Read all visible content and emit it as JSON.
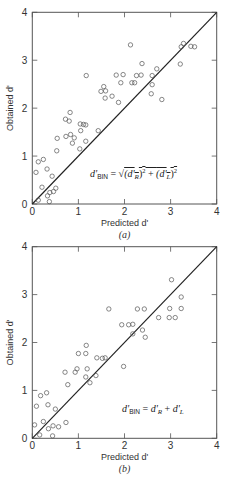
{
  "chart_data": [
    {
      "type": "scatter",
      "panel_label": "(a)",
      "xlabel": "Predicted d'",
      "ylabel": "Obtained d'",
      "xlim": [
        0,
        4
      ],
      "ylim": [
        0,
        4
      ],
      "xticks": [
        "0",
        "1",
        "2",
        "3",
        "4"
      ],
      "yticks": [
        "0",
        "1",
        "2",
        "3",
        "4"
      ],
      "grid": false,
      "annotation": "d'BIN = √((d'R)² + (d'L)²)",
      "reference_line": {
        "from": [
          0,
          0
        ],
        "to": [
          4,
          4
        ]
      },
      "points": [
        [
          0.08,
          0.66
        ],
        [
          0.13,
          0.88
        ],
        [
          0.24,
          0.93
        ],
        [
          0.13,
          0.08
        ],
        [
          0.21,
          0.35
        ],
        [
          0.32,
          0.73
        ],
        [
          0.33,
          0.17
        ],
        [
          0.38,
          0.24
        ],
        [
          0.37,
          0.05
        ],
        [
          0.43,
          0.58
        ],
        [
          0.46,
          0.26
        ],
        [
          0.51,
          0.33
        ],
        [
          0.53,
          1.11
        ],
        [
          0.54,
          1.37
        ],
        [
          0.72,
          1.77
        ],
        [
          0.8,
          1.73
        ],
        [
          0.82,
          1.91
        ],
        [
          0.73,
          1.41
        ],
        [
          0.83,
          1.45
        ],
        [
          0.87,
          1.27
        ],
        [
          0.91,
          1.38
        ],
        [
          1.03,
          1.15
        ],
        [
          1.04,
          1.67
        ],
        [
          1.05,
          1.53
        ],
        [
          1.11,
          1.66
        ],
        [
          1.16,
          1.65
        ],
        [
          1.16,
          1.31
        ],
        [
          1.17,
          2.68
        ],
        [
          1.43,
          1.53
        ],
        [
          1.49,
          2.35
        ],
        [
          1.55,
          2.45
        ],
        [
          1.59,
          2.36
        ],
        [
          1.58,
          2.21
        ],
        [
          1.73,
          2.25
        ],
        [
          1.82,
          2.69
        ],
        [
          1.87,
          2.12
        ],
        [
          1.92,
          2.53
        ],
        [
          1.97,
          2.7
        ],
        [
          2.13,
          3.32
        ],
        [
          2.16,
          2.53
        ],
        [
          2.22,
          2.53
        ],
        [
          2.26,
          2.68
        ],
        [
          2.36,
          2.69
        ],
        [
          2.38,
          2.93
        ],
        [
          2.58,
          2.3
        ],
        [
          2.6,
          2.49
        ],
        [
          2.6,
          2.68
        ],
        [
          2.7,
          2.82
        ],
        [
          2.81,
          2.18
        ],
        [
          3.21,
          2.92
        ],
        [
          3.23,
          3.28
        ],
        [
          3.28,
          3.35
        ],
        [
          3.44,
          3.29
        ],
        [
          3.52,
          3.28
        ]
      ]
    },
    {
      "type": "scatter",
      "panel_label": "(b)",
      "xlabel": "Predicted d'",
      "ylabel": "Obtained d'",
      "xlim": [
        0,
        4
      ],
      "ylim": [
        0,
        4
      ],
      "xticks": [
        "0",
        "1",
        "2",
        "3",
        "4"
      ],
      "yticks": [
        "0",
        "1",
        "2",
        "3",
        "4"
      ],
      "grid": false,
      "annotation": "d'BIN = d'R + d'L",
      "reference_line": {
        "from": [
          0,
          0
        ],
        "to": [
          4,
          4
        ]
      },
      "points": [
        [
          0.05,
          0.28
        ],
        [
          0.09,
          0.67
        ],
        [
          0.18,
          0.89
        ],
        [
          0.31,
          0.95
        ],
        [
          0.24,
          0.35
        ],
        [
          0.16,
          0.07
        ],
        [
          0.35,
          0.2
        ],
        [
          0.34,
          0.7
        ],
        [
          0.44,
          0.05
        ],
        [
          0.45,
          0.26
        ],
        [
          0.5,
          0.61
        ],
        [
          0.57,
          0.24
        ],
        [
          0.73,
          0.33
        ],
        [
          0.71,
          1.38
        ],
        [
          0.77,
          1.12
        ],
        [
          0.93,
          1.38
        ],
        [
          0.97,
          1.45
        ],
        [
          1.0,
          1.77
        ],
        [
          1.16,
          1.77
        ],
        [
          1.17,
          1.94
        ],
        [
          1.16,
          1.28
        ],
        [
          1.19,
          1.45
        ],
        [
          1.25,
          1.16
        ],
        [
          1.38,
          1.31
        ],
        [
          1.4,
          1.68
        ],
        [
          1.52,
          1.67
        ],
        [
          1.58,
          1.68
        ],
        [
          1.66,
          2.7
        ],
        [
          1.94,
          2.37
        ],
        [
          1.98,
          1.5
        ],
        [
          2.09,
          2.37
        ],
        [
          2.18,
          2.38
        ],
        [
          2.18,
          2.18
        ],
        [
          2.28,
          2.7
        ],
        [
          2.39,
          2.26
        ],
        [
          2.43,
          2.7
        ],
        [
          2.45,
          2.11
        ],
        [
          2.74,
          2.52
        ],
        [
          2.97,
          2.52
        ],
        [
          2.98,
          2.71
        ],
        [
          3.02,
          3.31
        ],
        [
          3.1,
          2.52
        ],
        [
          3.23,
          2.95
        ],
        [
          3.23,
          2.71
        ]
      ]
    }
  ],
  "panels": [
    {
      "caption": "(a)",
      "xlabel": "Predicted d'",
      "ylabel": "Obtained d'",
      "formula": {
        "lhs": "d'",
        "lhs_sub": "BIN",
        "eq": " = √",
        "r_open": "(d'",
        "r_sub": "R",
        "r_close": ")",
        "sq": "2",
        "plus": " + ",
        "l_open": "(d'",
        "l_sub": "L",
        "l_close": ")"
      }
    },
    {
      "caption": "(b)",
      "xlabel": "Predicted d'",
      "ylabel": "Obtained d'",
      "formula": {
        "lhs": "d'",
        "lhs_sub": "BIN",
        "eq": " = ",
        "r": "d'",
        "r_sub": "R",
        "plus": " + ",
        "l": "d'",
        "l_sub": "L"
      }
    }
  ]
}
